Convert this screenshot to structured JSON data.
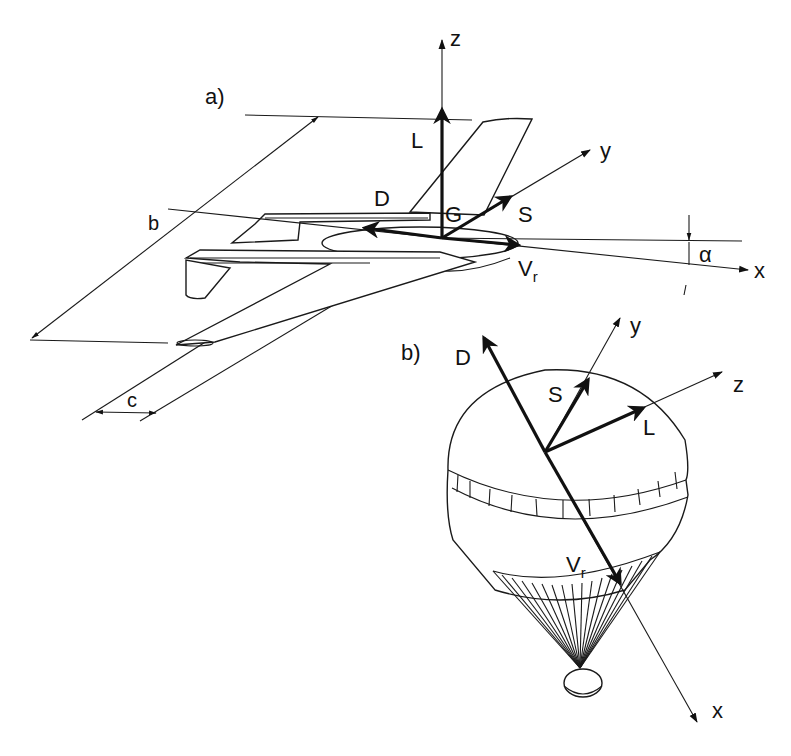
{
  "diagram": {
    "panel_a": {
      "label": "a)",
      "axes": {
        "x": "x",
        "y": "y",
        "z": "z"
      },
      "forces": {
        "lift": "L",
        "drag": "D",
        "side": "S",
        "velocity": "V",
        "velocity_sub": "r"
      },
      "center": "G",
      "angle": "α",
      "dimensions": {
        "span": "b",
        "chord": "c"
      }
    },
    "panel_b": {
      "label": "b)",
      "axes": {
        "x": "x",
        "y": "y",
        "z": "z"
      },
      "forces": {
        "lift": "L",
        "drag": "D",
        "side": "S",
        "velocity": "V",
        "velocity_sub": "r"
      }
    }
  }
}
